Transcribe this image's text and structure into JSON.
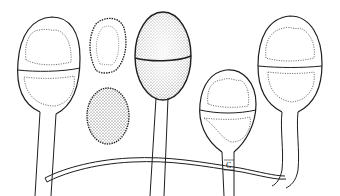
{
  "figure": {
    "labels": [
      "C"
    ],
    "colors": {
      "ink": "#1e1e1e",
      "background": "#ffffff",
      "stipple": "#3a3a3a"
    }
  }
}
